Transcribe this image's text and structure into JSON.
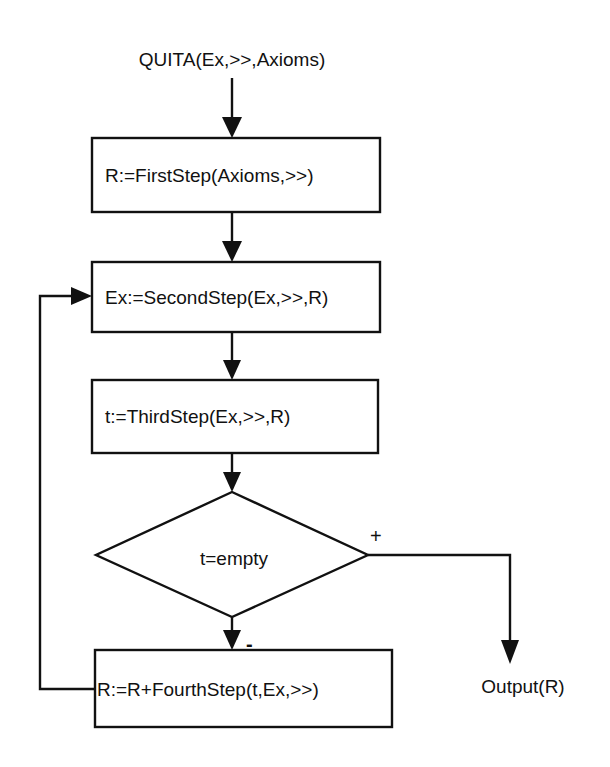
{
  "diagram": {
    "title": "QUITA(Ex,>>,Axioms)",
    "nodes": [
      {
        "id": "start",
        "type": "terminal",
        "label": "QUITA(Ex,>>,Axioms)"
      },
      {
        "id": "step1",
        "type": "process",
        "label": "R:=FirstStep(Axioms,>>)"
      },
      {
        "id": "step2",
        "type": "process",
        "label": "Ex:=SecondStep(Ex,>>,R)"
      },
      {
        "id": "step3",
        "type": "process",
        "label": "t:=ThirdStep(Ex,>>,R)"
      },
      {
        "id": "decision",
        "type": "decision",
        "label": "t=empty"
      },
      {
        "id": "step4",
        "type": "process",
        "label": "R:=R+FourthStep(t,Ex,>>)"
      },
      {
        "id": "output",
        "type": "terminal",
        "label": "Output(R)"
      }
    ],
    "edges": [
      {
        "from": "start",
        "to": "step1",
        "label": ""
      },
      {
        "from": "step1",
        "to": "step2",
        "label": ""
      },
      {
        "from": "step2",
        "to": "step3",
        "label": ""
      },
      {
        "from": "step3",
        "to": "decision",
        "label": ""
      },
      {
        "from": "decision",
        "to": "output",
        "label": "+"
      },
      {
        "from": "decision",
        "to": "step4",
        "label": "-"
      },
      {
        "from": "step4",
        "to": "step2",
        "label": ""
      }
    ],
    "branch_labels": {
      "yes": "+",
      "no": "-"
    },
    "colors": {
      "stroke": "#111111",
      "background": "#ffffff"
    }
  }
}
